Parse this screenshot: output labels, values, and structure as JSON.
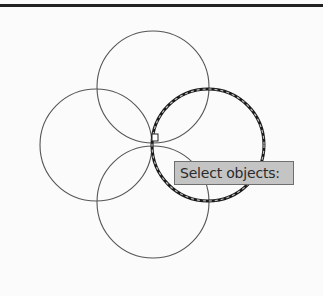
{
  "drawing": {
    "circles": [
      {
        "id": "top",
        "cx": 153,
        "cy": 87,
        "r": 56,
        "selected": false
      },
      {
        "id": "left",
        "cx": 96,
        "cy": 145,
        "r": 56,
        "selected": false
      },
      {
        "id": "bottom",
        "cx": 153,
        "cy": 202,
        "r": 56,
        "selected": false
      },
      {
        "id": "right",
        "cx": 208,
        "cy": 145,
        "r": 56,
        "selected": true
      }
    ],
    "cursor": {
      "type": "pickbox",
      "x": 152,
      "y": 134,
      "size": 6
    },
    "colors": {
      "line": "#555555",
      "selected_line": "#1a1a1a",
      "background": "#fbfbfb"
    }
  },
  "tooltip": {
    "prompt": "Select objects:"
  }
}
